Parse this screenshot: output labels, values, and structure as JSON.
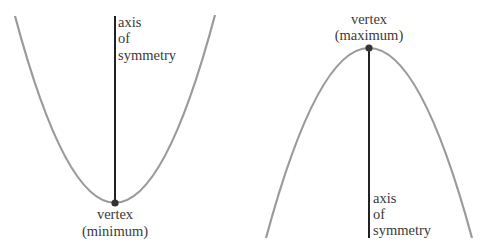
{
  "diagrams": [
    {
      "id": "upward",
      "axis_label_lines": [
        "axis",
        "of",
        "symmetry"
      ],
      "vertex_label_lines": [
        "vertex",
        "(minimum)"
      ]
    },
    {
      "id": "downward",
      "axis_label_lines": [
        "axis",
        "of",
        "symmetry"
      ],
      "vertex_label_lines": [
        "vertex",
        "(maximum)"
      ]
    }
  ],
  "colors": {
    "curve": "#9a9a9a",
    "axis": "#222222",
    "vertex_dot": "#333333",
    "text": "#3a3a3a"
  }
}
